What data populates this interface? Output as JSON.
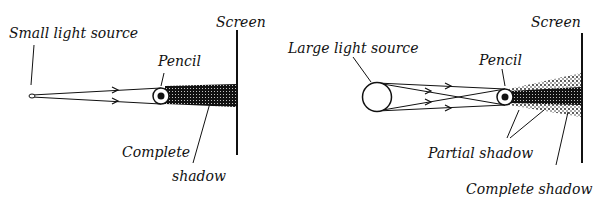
{
  "left_diagram": {
    "title": "Small light source setup",
    "labels": {
      "source": "Small light source",
      "pencil": "Pencil",
      "screen": "Screen",
      "shadow_line1": "Complete",
      "shadow_line2": "shadow"
    }
  },
  "right_diagram": {
    "title": "Large light source setup",
    "labels": {
      "source": "Large light source",
      "pencil": "Pencil",
      "screen": "Screen",
      "partial": "Partial shadow",
      "complete": "Complete shadow"
    }
  },
  "colors": {
    "ink": "#111111",
    "background": "#ffffff"
  }
}
